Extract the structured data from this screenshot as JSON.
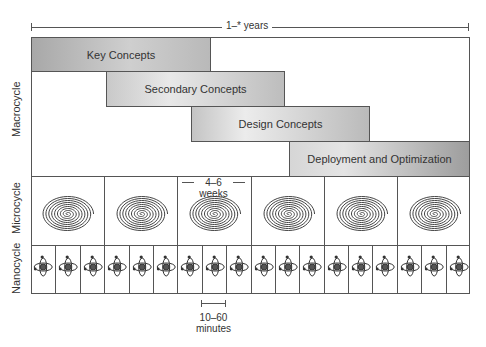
{
  "diagram": {
    "duration_label": "1–* years",
    "rows": [
      {
        "name": "Macrocycle",
        "label": "Macrocycle"
      },
      {
        "name": "Microcycle",
        "label": "Microcycle"
      },
      {
        "name": "Nanocycle",
        "label": "Nanocycle"
      }
    ],
    "phases": [
      {
        "label": "Key Concepts"
      },
      {
        "label": "Secondary Concepts"
      },
      {
        "label": "Design Concepts"
      },
      {
        "label": "Deployment and Optimization"
      }
    ],
    "microcycle": {
      "count": 6,
      "icon": "spiral-icon",
      "duration_label_line1": "4–6",
      "duration_label_line2": "weeks"
    },
    "nanocycle": {
      "count": 18,
      "icon": "atom-icon",
      "duration_label_line1": "10–60",
      "duration_label_line2": "minutes"
    }
  }
}
